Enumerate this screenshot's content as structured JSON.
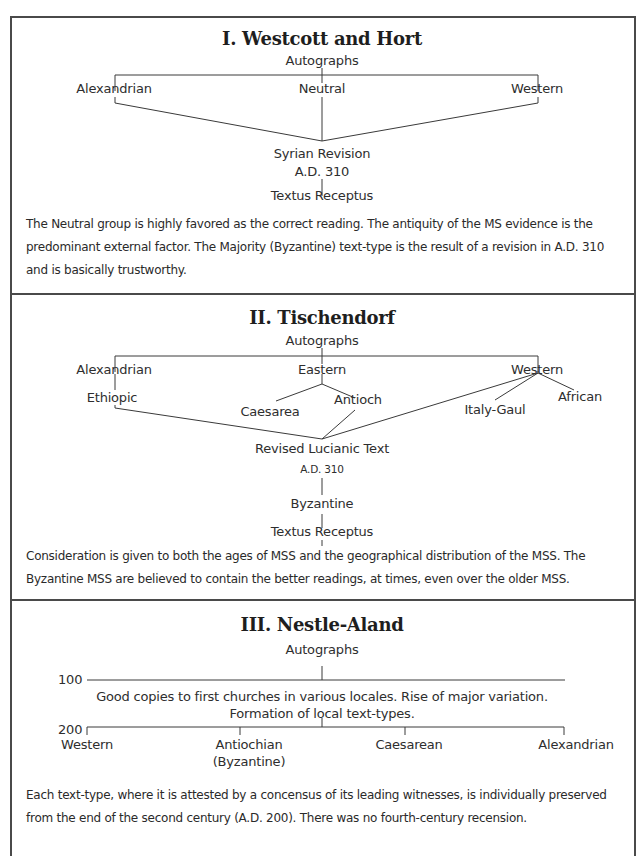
{
  "sections": [
    {
      "title": "I. Westcott and Hort",
      "nodes": {
        "root": "Autographs",
        "alexandrian": "Alexandrian",
        "neutral": "Neutral",
        "western": "Western",
        "revision": "Syrian Revision",
        "revision_date": "A.D. 310",
        "textus": "Textus Receptus"
      },
      "description": "The Neutral group is highly favored as the correct reading. The antiquity of the MS evidence is the predominant external factor. The Majority (Byzantine) text-type is the result of a revision in A.D. 310 and is basically trustworthy."
    },
    {
      "title": "II. Tischendorf",
      "nodes": {
        "root": "Autographs",
        "alexandrian": "Alexandrian",
        "eastern": "Eastern",
        "western": "Western",
        "ethiopic": "Ethiopic",
        "caesarea": "Caesarea",
        "antioch": "Antioch",
        "italy_gaul": "Italy-Gaul",
        "african": "African",
        "revised": "Revised Lucianic Text",
        "revised_date": "A.D. 310",
        "byzantine": "Byzantine",
        "textus": "Textus Receptus"
      },
      "description": "Consideration is given to both the ages of MSS and the geographical distribution of the MSS. The Byzantine MSS are believed to contain the better readings, at times, even over the older MSS."
    },
    {
      "title": "III. Nestle-Aland",
      "nodes": {
        "root": "Autographs",
        "year_100": "100",
        "year_200": "200",
        "note_line1": "Good copies to first churches in various locales. Rise of major variation.",
        "note_line2": "Formation of local text-types.",
        "western": "Western",
        "antiochian": "Antiochian",
        "antiochian_alt": "(Byzantine)",
        "caesarean": "Caesarean",
        "alexandrian": "Alexandrian"
      },
      "description": "Each text-type, where it is attested by a concensus of its leading witnesses, is individually preserved from the end of the second century (A.D. 200). There was no fourth-century recension."
    }
  ]
}
